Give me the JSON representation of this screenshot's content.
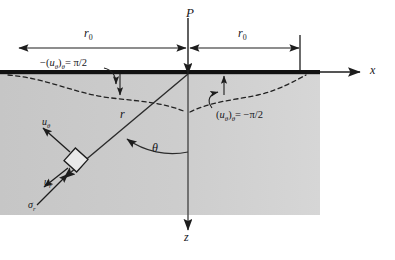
{
  "figure": {
    "name": "flamant-line-load-elastic-half-space",
    "colors": {
      "half_space_fill": "#c9c9c9",
      "surface_line": "#111111",
      "line": "#2b2b2b",
      "dashed_curve": "#222222",
      "text": "#16161a",
      "background": "#ffffff"
    }
  },
  "labels": {
    "load": "P",
    "x_axis": "x",
    "z_axis": "z",
    "radius": "r",
    "angle": "θ",
    "r0_left": "r",
    "r0_left_sub": "0",
    "r0_right": "r",
    "r0_right_sub": "0",
    "u_theta_vector": "u",
    "u_theta_vector_sub": "θ",
    "u_r_vector": "u",
    "u_r_vector_sub": "r",
    "sigma_r_vector": "σ",
    "sigma_r_vector_sub": "r",
    "condition_left_prefix": "−(",
    "condition_left_u": "u",
    "condition_left_u_sub": "θ",
    "condition_left_mid": ")",
    "condition_left_cond_sub": "θ",
    "condition_left_value": "= π/2",
    "condition_right_prefix": "(",
    "condition_right_u": "u",
    "condition_right_u_sub": "θ",
    "condition_right_mid": ")",
    "condition_right_cond_sub": "θ",
    "condition_right_value": "= −π/2"
  },
  "geometry": {
    "origin_x": 188,
    "surface_y": 72,
    "r0_dimension_y": 48,
    "r0_left_end_x": 18,
    "r0_right_end_x": 300,
    "half_space_left": 0,
    "half_space_right": 320,
    "half_space_bottom": 215,
    "theta_degrees": 35,
    "z_axis_end_y": 232,
    "x_axis_end_x": 365
  }
}
